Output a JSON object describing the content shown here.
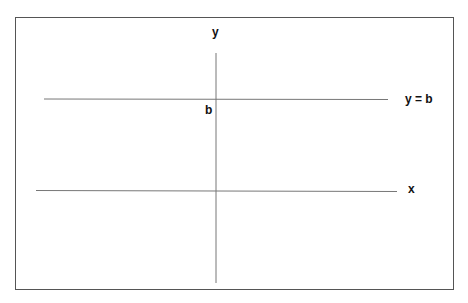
{
  "diagram": {
    "y_axis_label": "y",
    "x_axis_label": "x",
    "intercept_label": "b",
    "line_label": "y = b",
    "line_color": "#777777",
    "border_color": "#555555"
  }
}
